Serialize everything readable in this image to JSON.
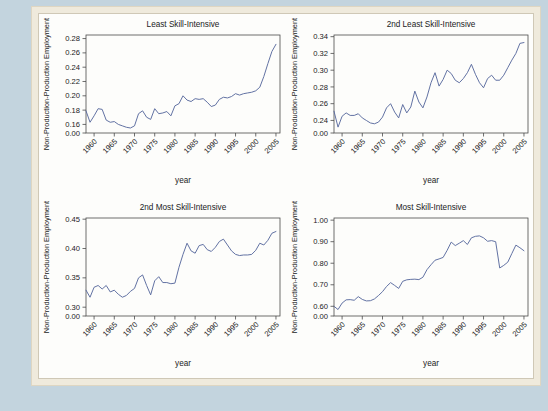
{
  "figure": {
    "background_color": "#c3d4de",
    "paper_color": "#efeadc",
    "plot_background": "#fdfdfb",
    "line_color": "#5a6a9e",
    "axis_color": "#4a4a4a",
    "shared_xlabel": "year",
    "shared_ylabel": "Non-Production-Production Employment",
    "xtick_labels": [
      "1960",
      "1965",
      "1970",
      "1975",
      "1980",
      "1985",
      "1990",
      "1995",
      "2000",
      "2005"
    ],
    "xticks": [
      1960,
      1965,
      1970,
      1975,
      1980,
      1985,
      1990,
      1995,
      2000,
      2005
    ],
    "xlim": [
      1958,
      2006
    ]
  },
  "chart_data": [
    {
      "type": "line",
      "title": "Least Skill-Intensive",
      "xlabel": "year",
      "ylabel": "Non-Production-Production Employment",
      "ylim": [
        0.148,
        0.285
      ],
      "ytick_labels": [
        "0.00",
        "0.16",
        "0.18",
        "0.20",
        "0.22",
        "0.24",
        "0.26",
        "0.28"
      ],
      "yticks": [
        0.148,
        0.16,
        0.18,
        0.2,
        0.22,
        0.24,
        0.26,
        0.28
      ],
      "zero_break_label": "0.00",
      "x": [
        1958,
        1959,
        1960,
        1961,
        1962,
        1963,
        1964,
        1965,
        1966,
        1967,
        1968,
        1969,
        1970,
        1971,
        1972,
        1973,
        1974,
        1975,
        1976,
        1977,
        1978,
        1979,
        1980,
        1981,
        1982,
        1983,
        1984,
        1985,
        1986,
        1987,
        1988,
        1989,
        1990,
        1991,
        1992,
        1993,
        1994,
        1995,
        1996,
        1997,
        1998,
        1999,
        2000,
        2001,
        2002,
        2003,
        2004,
        2005
      ],
      "values": [
        0.179,
        0.163,
        0.172,
        0.182,
        0.181,
        0.166,
        0.163,
        0.164,
        0.16,
        0.158,
        0.156,
        0.155,
        0.158,
        0.175,
        0.179,
        0.17,
        0.167,
        0.182,
        0.175,
        0.176,
        0.178,
        0.172,
        0.186,
        0.189,
        0.2,
        0.194,
        0.192,
        0.196,
        0.195,
        0.196,
        0.191,
        0.185,
        0.187,
        0.195,
        0.198,
        0.197,
        0.199,
        0.203,
        0.201,
        0.203,
        0.204,
        0.205,
        0.207,
        0.212,
        0.227,
        0.245,
        0.262,
        0.272
      ]
    },
    {
      "type": "line",
      "title": "2nd Least Skill-Intensive",
      "xlabel": "year",
      "ylabel": "Non-Production-Production Employment",
      "ylim": [
        0.225,
        0.342
      ],
      "ytick_labels": [
        "0.00",
        "0.24",
        "0.26",
        "0.28",
        "0.30",
        "0.32",
        "0.34"
      ],
      "yticks": [
        0.225,
        0.24,
        0.26,
        0.28,
        0.3,
        0.32,
        0.34
      ],
      "zero_break_label": "0.00",
      "x": [
        1958,
        1959,
        1960,
        1961,
        1962,
        1963,
        1964,
        1965,
        1966,
        1967,
        1968,
        1969,
        1970,
        1971,
        1972,
        1973,
        1974,
        1975,
        1976,
        1977,
        1978,
        1979,
        1980,
        1981,
        1982,
        1983,
        1984,
        1985,
        1986,
        1987,
        1988,
        1989,
        1990,
        1991,
        1992,
        1993,
        1994,
        1995,
        1996,
        1997,
        1998,
        1999,
        2000,
        2001,
        2002,
        2003,
        2004,
        2005
      ],
      "values": [
        0.251,
        0.232,
        0.245,
        0.249,
        0.246,
        0.246,
        0.248,
        0.243,
        0.24,
        0.237,
        0.236,
        0.238,
        0.244,
        0.255,
        0.26,
        0.25,
        0.243,
        0.259,
        0.249,
        0.256,
        0.275,
        0.262,
        0.255,
        0.268,
        0.285,
        0.297,
        0.281,
        0.289,
        0.3,
        0.296,
        0.288,
        0.285,
        0.29,
        0.297,
        0.307,
        0.295,
        0.285,
        0.279,
        0.29,
        0.294,
        0.288,
        0.288,
        0.294,
        0.303,
        0.312,
        0.32,
        0.332,
        0.333
      ]
    },
    {
      "type": "line",
      "title": "2nd Most Skill-Intensive",
      "xlabel": "year",
      "ylabel": "Non-Production-Production Employment",
      "ylim": [
        0.285,
        0.452
      ],
      "ytick_labels": [
        "0.00",
        "0.30",
        "0.35",
        "0.40",
        "0.45"
      ],
      "yticks": [
        0.285,
        0.3,
        0.35,
        0.4,
        0.45
      ],
      "zero_break_label": "0.00",
      "x": [
        1958,
        1959,
        1960,
        1961,
        1962,
        1963,
        1964,
        1965,
        1966,
        1967,
        1968,
        1969,
        1970,
        1971,
        1972,
        1973,
        1974,
        1975,
        1976,
        1977,
        1978,
        1979,
        1980,
        1981,
        1982,
        1983,
        1984,
        1985,
        1986,
        1987,
        1988,
        1989,
        1990,
        1991,
        1992,
        1993,
        1994,
        1995,
        1996,
        1997,
        1998,
        1999,
        2000,
        2001,
        2002,
        2003,
        2004,
        2005
      ],
      "values": [
        0.329,
        0.317,
        0.334,
        0.337,
        0.331,
        0.337,
        0.326,
        0.329,
        0.322,
        0.317,
        0.32,
        0.327,
        0.332,
        0.35,
        0.355,
        0.337,
        0.321,
        0.345,
        0.352,
        0.342,
        0.342,
        0.34,
        0.341,
        0.368,
        0.39,
        0.409,
        0.396,
        0.392,
        0.405,
        0.407,
        0.398,
        0.395,
        0.402,
        0.412,
        0.416,
        0.406,
        0.396,
        0.39,
        0.388,
        0.389,
        0.389,
        0.39,
        0.397,
        0.409,
        0.406,
        0.414,
        0.426,
        0.429
      ]
    },
    {
      "type": "line",
      "title": "Most Skill-Intensive",
      "xlabel": "year",
      "ylabel": "Non-Production-Production Employment",
      "ylim": [
        0.555,
        1.01
      ],
      "ytick_labels": [
        "0.00",
        "0.60",
        "0.70",
        "0.80",
        "0.90",
        "1.00"
      ],
      "yticks": [
        0.555,
        0.6,
        0.7,
        0.8,
        0.9,
        1.0
      ],
      "zero_break_label": "0.00",
      "x": [
        1958,
        1959,
        1960,
        1961,
        1962,
        1963,
        1964,
        1965,
        1966,
        1967,
        1968,
        1969,
        1970,
        1971,
        1972,
        1973,
        1974,
        1975,
        1976,
        1977,
        1978,
        1979,
        1980,
        1981,
        1982,
        1983,
        1984,
        1985,
        1986,
        1987,
        1988,
        1989,
        1990,
        1991,
        1992,
        1993,
        1994,
        1995,
        1996,
        1997,
        1998,
        1999,
        2000,
        2001,
        2002,
        2003,
        2004,
        2005
      ],
      "values": [
        0.6,
        0.585,
        0.615,
        0.63,
        0.631,
        0.628,
        0.645,
        0.632,
        0.625,
        0.626,
        0.634,
        0.65,
        0.668,
        0.692,
        0.71,
        0.697,
        0.683,
        0.716,
        0.723,
        0.725,
        0.726,
        0.724,
        0.735,
        0.77,
        0.793,
        0.814,
        0.82,
        0.827,
        0.86,
        0.898,
        0.882,
        0.893,
        0.905,
        0.887,
        0.918,
        0.925,
        0.927,
        0.918,
        0.902,
        0.905,
        0.9,
        0.778,
        0.79,
        0.805,
        0.845,
        0.884,
        0.872,
        0.858
      ]
    }
  ]
}
